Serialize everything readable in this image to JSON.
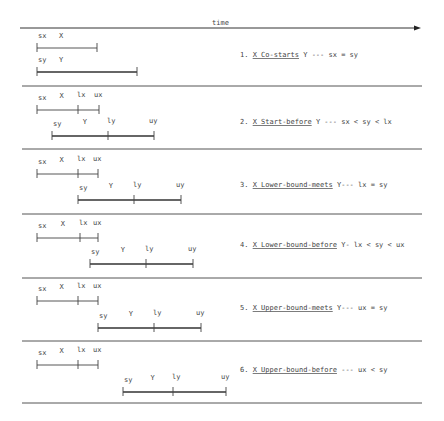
{
  "axis": {
    "label": "time"
  },
  "rows": [
    {
      "number": "1.",
      "relation": "X Co-starts",
      "tail": " Y   ---   sx = sy",
      "x": {
        "name": "X",
        "start_label": "sx",
        "start": 0,
        "end": 60,
        "mid": null,
        "mid_label": null,
        "end_label": null
      },
      "y": {
        "name": "Y",
        "start_label": "sy",
        "start": 0,
        "end": 100,
        "mid": null,
        "mid_label": null,
        "end_label": null
      }
    },
    {
      "number": "2.",
      "relation": "X Start-before",
      "tail": " Y ---  sx < sy < lx",
      "x": {
        "name": "X",
        "start_label": "sx",
        "start": 0,
        "end": 62,
        "mid": 41,
        "mid_label": "lx",
        "end_label": "ux"
      },
      "y": {
        "name": "Y",
        "start_label": "sy",
        "start": 15,
        "end": 117,
        "mid": 71,
        "mid_label": "ly",
        "end_label": "uy"
      }
    },
    {
      "number": "3.",
      "relation": "X Lower-bound-meets",
      "tail": " Y---   lx = sy",
      "x": {
        "name": "X",
        "start_label": "sx",
        "start": 0,
        "end": 61,
        "mid": 41,
        "mid_label": "lx",
        "end_label": "ux"
      },
      "y": {
        "name": "Y",
        "start_label": "sy",
        "start": 41,
        "end": 144,
        "mid": 97,
        "mid_label": "ly",
        "end_label": "uy"
      }
    },
    {
      "number": "4.",
      "relation": "X Lower-bound-before",
      "tail": " Y- lx < sy < ux",
      "x": {
        "name": "X",
        "start_label": "sx",
        "start": 0,
        "end": 61,
        "mid": 43,
        "mid_label": "lx",
        "end_label": "ux"
      },
      "y": {
        "name": "Y",
        "start_label": "sy",
        "start": 53,
        "end": 156,
        "mid": 109,
        "mid_label": "ly",
        "end_label": "uy"
      }
    },
    {
      "number": "5.",
      "relation": "X Upper-bound-meets",
      "tail": " Y---   ux = sy",
      "x": {
        "name": "X",
        "start_label": "sx",
        "start": 0,
        "end": 61,
        "mid": 41,
        "mid_label": "lx",
        "end_label": "ux"
      },
      "y": {
        "name": "Y",
        "start_label": "sy",
        "start": 61,
        "end": 164,
        "mid": 117,
        "mid_label": "ly",
        "end_label": "uy"
      }
    },
    {
      "number": "6.",
      "relation": "X Upper-bound-before",
      "tail": "  ---  ux < sy",
      "x": {
        "name": "X",
        "start_label": "sx",
        "start": 0,
        "end": 61,
        "mid": 41,
        "mid_label": "lx",
        "end_label": "ux"
      },
      "y": {
        "name": "Y",
        "start_label": "sy",
        "start": 86,
        "end": 189,
        "mid": 136,
        "mid_label": "ly",
        "end_label": "uy"
      }
    }
  ]
}
